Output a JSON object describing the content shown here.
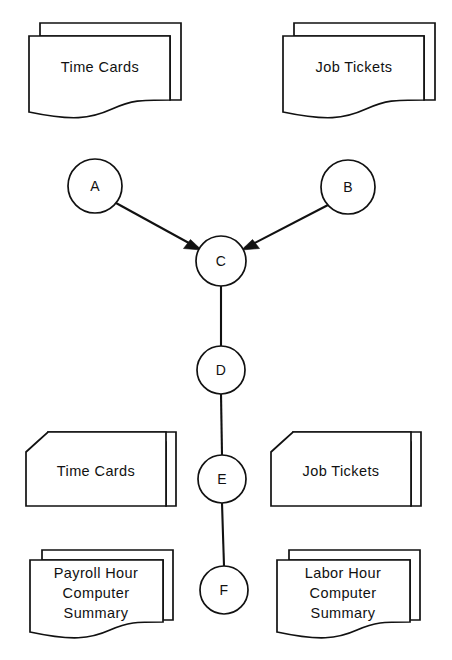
{
  "diagram": {
    "colors": {
      "stroke": "#111111",
      "fill": "#ffffff",
      "background": "#ffffff"
    },
    "documents": [
      {
        "id": "doc-time-cards-top",
        "name": "time-cards-document-top",
        "shape": "multi-document",
        "lines": [
          "Time Cards"
        ],
        "position": "top-left"
      },
      {
        "id": "doc-job-tickets-top",
        "name": "job-tickets-document-top",
        "shape": "multi-document",
        "lines": [
          "Job Tickets"
        ],
        "position": "top-right"
      },
      {
        "id": "doc-time-cards-bottom",
        "name": "time-cards-punch-card",
        "shape": "multi-punch-card",
        "lines": [
          "Time Cards"
        ],
        "position": "bottom-left"
      },
      {
        "id": "doc-job-tickets-bottom",
        "name": "job-tickets-punch-card",
        "shape": "multi-punch-card",
        "lines": [
          "Job Tickets"
        ],
        "position": "bottom-right"
      },
      {
        "id": "doc-payroll-summary",
        "name": "payroll-hour-computer-summary-document",
        "shape": "multi-document",
        "lines": [
          "Payroll Hour",
          "Computer",
          "Summary"
        ],
        "position": "bottom-left-lower"
      },
      {
        "id": "doc-labor-summary",
        "name": "labor-hour-computer-summary-document",
        "shape": "multi-document",
        "lines": [
          "Labor Hour",
          "Computer",
          "Summary"
        ],
        "position": "bottom-right-lower"
      }
    ],
    "nodes": [
      {
        "id": "A",
        "label": "A",
        "cx": 95,
        "cy": 186,
        "r": 27
      },
      {
        "id": "B",
        "label": "B",
        "cx": 348,
        "cy": 187,
        "r": 27
      },
      {
        "id": "C",
        "label": "C",
        "cx": 221,
        "cy": 261,
        "r": 25
      },
      {
        "id": "D",
        "label": "D",
        "cx": 221,
        "cy": 370,
        "r": 24
      },
      {
        "id": "E",
        "label": "E",
        "cx": 222,
        "cy": 479,
        "r": 24
      },
      {
        "id": "F",
        "label": "F",
        "cx": 224,
        "cy": 590,
        "r": 24
      }
    ],
    "connections": [
      {
        "from": "A",
        "to": "C",
        "arrow": true
      },
      {
        "from": "B",
        "to": "C",
        "arrow": true
      },
      {
        "from": "C",
        "to": "D",
        "arrow": false
      },
      {
        "from": "D",
        "to": "E",
        "arrow": false
      },
      {
        "from": "E",
        "to": "F",
        "arrow": false
      }
    ]
  }
}
